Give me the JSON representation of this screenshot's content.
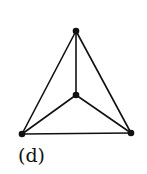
{
  "figure": {
    "caption": "(d)",
    "colors": {
      "stroke": "#111111",
      "background": "#ffffff"
    },
    "vertices": [
      {
        "id": "top",
        "x": 76,
        "y": 31
      },
      {
        "id": "center",
        "x": 76,
        "y": 95
      },
      {
        "id": "bottom-left",
        "x": 22,
        "y": 134
      },
      {
        "id": "bottom-right",
        "x": 131,
        "y": 133
      }
    ],
    "edges": [
      [
        "top",
        "bottom-left"
      ],
      [
        "top",
        "bottom-right"
      ],
      [
        "bottom-left",
        "bottom-right"
      ],
      [
        "top",
        "center"
      ],
      [
        "center",
        "bottom-left"
      ],
      [
        "center",
        "bottom-right"
      ]
    ]
  }
}
